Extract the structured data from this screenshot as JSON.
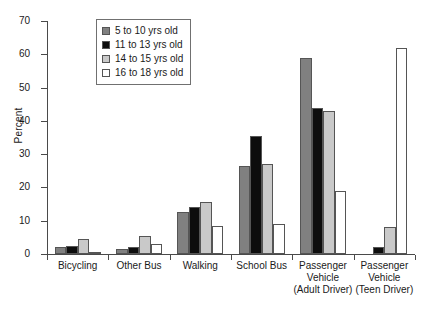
{
  "chart_data": {
    "type": "bar",
    "title": "",
    "xlabel": "",
    "ylabel": "Percent",
    "ylim": [
      0,
      70
    ],
    "yticks": [
      0,
      10,
      20,
      30,
      40,
      50,
      60,
      70
    ],
    "grid": false,
    "legend_position": "top-left-inside",
    "categories": [
      "Bicycling",
      "Other Bus",
      "Walking",
      "School Bus",
      "Passenger Vehicle (Adult Driver)",
      "Passenger Vehicle (Teen Driver)"
    ],
    "category_lines": [
      [
        "Bicycling"
      ],
      [
        "Other Bus"
      ],
      [
        "Walking"
      ],
      [
        "School Bus"
      ],
      [
        "Passenger",
        "Vehicle",
        "(Adult Driver)"
      ],
      [
        "Passenger",
        "Vehicle",
        "(Teen Driver)"
      ]
    ],
    "series": [
      {
        "name": "5 to 10 yrs old",
        "color": "#808080",
        "values": [
          2.0,
          1.5,
          12.5,
          26.5,
          59.0,
          0.0
        ]
      },
      {
        "name": "11 to 13 yrs old",
        "color": "#0d0d0d",
        "values": [
          2.5,
          2.0,
          14.0,
          35.5,
          44.0,
          2.0
        ]
      },
      {
        "name": "14 to 15 yrs old",
        "color": "#c9c9c9",
        "values": [
          4.5,
          5.5,
          15.5,
          27.0,
          43.0,
          8.0
        ]
      },
      {
        "name": "16 to 18 yrs old",
        "color": "#ffffff",
        "values": [
          0.5,
          3.0,
          8.5,
          9.0,
          19.0,
          62.0
        ]
      }
    ]
  },
  "axis": {
    "y_title": "Percent"
  },
  "legend": {
    "entries": [
      {
        "label": "5 to 10 yrs old",
        "color": "#808080"
      },
      {
        "label": "11 to 13 yrs old",
        "color": "#0d0d0d"
      },
      {
        "label": "14 to 15 yrs old",
        "color": "#c9c9c9"
      },
      {
        "label": "16 to 18 yrs old",
        "color": "#ffffff"
      }
    ]
  }
}
